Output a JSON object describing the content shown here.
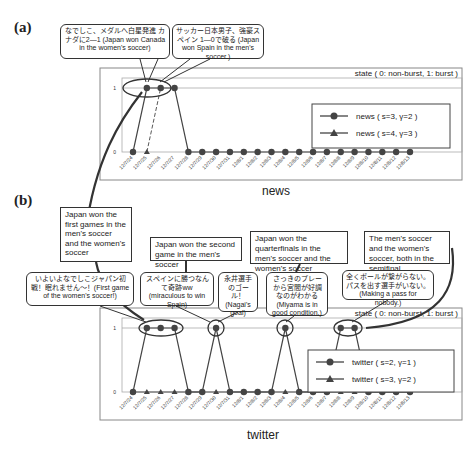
{
  "panels": {
    "a": {
      "label": "(a)",
      "title": "news"
    },
    "b": {
      "label": "(b)",
      "title": "twitter"
    }
  },
  "state_label": "state ( 0: non-burst, 1: burst )",
  "callouts_a": [
    {
      "text": "なでしこ、メダルへ白星発進 カナダに2—1 (Japan won Canada in the women's soccer)"
    },
    {
      "text": "サッカー日本男子、強豪スペイン 1—0で破る (Japan won Spain in the men's soccer.)"
    }
  ],
  "notes_b": [
    {
      "text": "Japan won the first games in the men's soccer and the women's soccer"
    },
    {
      "text": "Japan won the second game in the men's soccer"
    },
    {
      "text": "Japan won the quarterfinals in the men's soccer and the women's soccer"
    },
    {
      "text": "The men's soccer and the women's soccer, both in the semifinal"
    }
  ],
  "callouts_b": [
    {
      "text": "いよいよなでしこジャパン初戦！眠れません〜！(First game of the women's soccer!)"
    },
    {
      "text": "スペインに勝つなんて奇跡ww (miraculous to win Spain)"
    },
    {
      "text": "永井選手のゴール！(Nagai's goal)"
    },
    {
      "text": "さっきのプレーから宮間が好調なのがわかる (Miyama is in good condition.)"
    },
    {
      "text": "全くボールが繋がらない。パスを出す選手がいない。(Making a pass for nobody.)"
    }
  ],
  "chart_data": [
    {
      "type": "line",
      "title": "news",
      "ylabel": "state ( 0: non-burst, 1: burst )",
      "xlabel": "",
      "ylim": [
        0,
        1
      ],
      "yticks": [
        "0",
        "1"
      ],
      "categories": [
        "12/7/24",
        "12/7/25",
        "12/7/26",
        "12/7/27",
        "12/7/28",
        "12/7/29",
        "12/7/30",
        "12/7/31",
        "12/8/1",
        "12/8/2",
        "12/8/3",
        "12/8/4",
        "12/8/5",
        "12/8/6",
        "12/8/7",
        "12/8/8",
        "12/8/9",
        "12/8/10",
        "12/8/11",
        "12/8/12",
        "12/8/13"
      ],
      "series": [
        {
          "name": "news ( s=3, γ=2 )",
          "marker": "circle",
          "values": [
            0,
            1,
            1,
            1,
            0,
            0,
            0,
            0,
            0,
            0,
            0,
            0,
            0,
            0,
            0,
            0,
            0,
            0,
            0,
            0,
            0
          ]
        },
        {
          "name": "news ( s=4, γ=3 )",
          "marker": "triangle",
          "values": [
            null,
            0,
            1,
            null,
            null,
            null,
            null,
            null,
            null,
            null,
            null,
            null,
            null,
            null,
            null,
            null,
            null,
            null,
            null,
            null,
            null
          ]
        }
      ],
      "legend_position": "right"
    },
    {
      "type": "line",
      "title": "twitter",
      "ylabel": "state ( 0: non-burst, 1: burst )",
      "xlabel": "",
      "ylim": [
        0,
        1
      ],
      "yticks": [
        "0",
        "1"
      ],
      "categories": [
        "12/7/24",
        "12/7/25",
        "12/7/26",
        "12/7/27",
        "12/7/28",
        "12/7/29",
        "12/7/30",
        "12/7/31",
        "12/8/1",
        "12/8/2",
        "12/8/3",
        "12/8/4",
        "12/8/5",
        "12/8/6",
        "12/8/7",
        "12/8/8",
        "12/8/9",
        "12/8/10",
        "12/8/11",
        "12/8/12",
        "12/8/13"
      ],
      "series": [
        {
          "name": "twitter ( s=2, γ=1 )",
          "marker": "circle",
          "values": [
            0,
            1,
            1,
            1,
            0,
            0,
            1,
            0,
            0,
            0,
            0,
            1,
            0,
            0,
            0,
            1,
            1,
            0,
            0,
            0,
            0
          ]
        },
        {
          "name": "twitter ( s=3, γ=2 )",
          "marker": "triangle",
          "values": [
            0,
            0,
            0,
            0,
            0,
            0,
            0,
            0,
            0,
            0,
            0,
            0,
            0,
            0,
            0,
            0,
            0,
            0,
            0,
            0,
            0
          ]
        }
      ],
      "legend_position": "right"
    }
  ]
}
